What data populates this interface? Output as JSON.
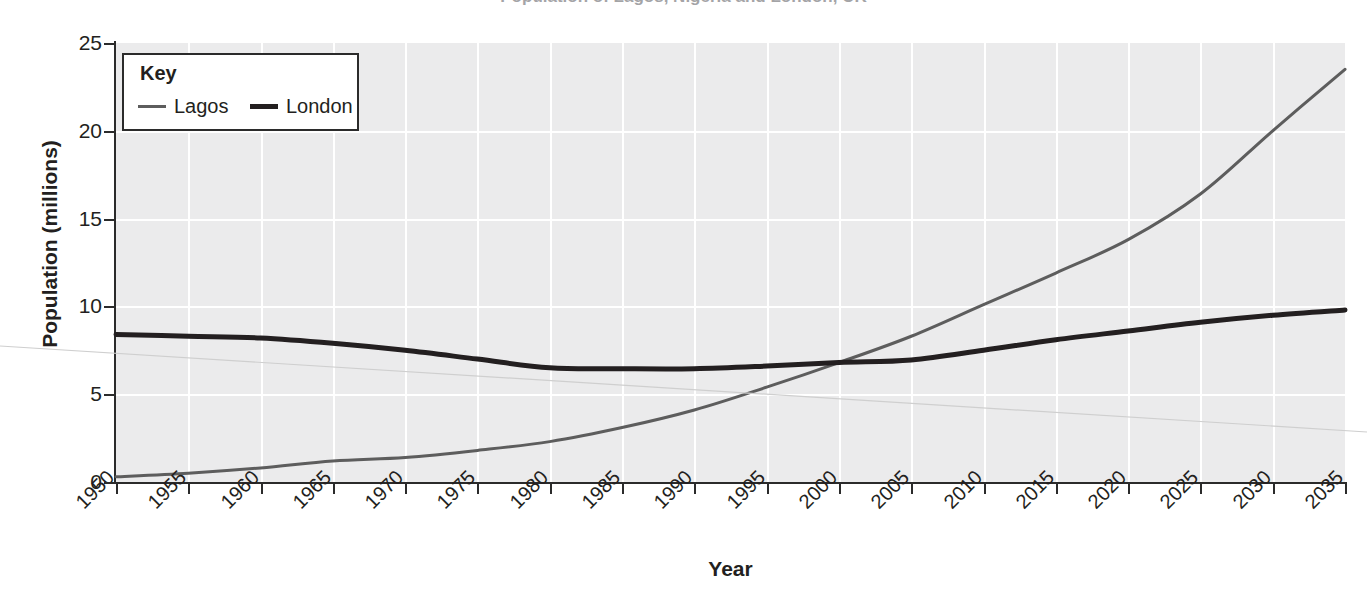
{
  "title_cropped": "Population of Lagos, Nigeria and London, UK",
  "chart_data": {
    "type": "line",
    "title": "Population of Lagos, Nigeria and London, UK",
    "xlabel": "Year",
    "ylabel": "Population (millions)",
    "xlim": [
      1950,
      2035
    ],
    "ylim": [
      0,
      25
    ],
    "grid": true,
    "legend_position": "top-left-inside",
    "legend_title": "Key",
    "x_tick_labels": [
      "1950",
      "1955",
      "1960",
      "1965",
      "1970",
      "1975",
      "1980",
      "1985",
      "1990",
      "1995",
      "2000",
      "2005",
      "2010",
      "2015",
      "2020",
      "2025",
      "2030",
      "2035"
    ],
    "y_tick_labels": [
      "0",
      "5",
      "10",
      "15",
      "20",
      "25"
    ],
    "x": [
      1950,
      1955,
      1960,
      1965,
      1970,
      1975,
      1980,
      1985,
      1990,
      1995,
      2000,
      2005,
      2010,
      2015,
      2020,
      2025,
      2030,
      2035
    ],
    "series": [
      {
        "name": "Lagos",
        "color": "#5d5d5d",
        "width": 3,
        "values": [
          0.3,
          0.5,
          0.8,
          1.2,
          1.4,
          1.8,
          2.3,
          3.1,
          4.1,
          5.4,
          6.8,
          8.3,
          10.1,
          11.9,
          13.8,
          16.4,
          20.0,
          23.5
        ]
      },
      {
        "name": "London",
        "color": "#231f20",
        "width": 5,
        "values": [
          8.4,
          8.3,
          8.2,
          7.9,
          7.5,
          7.0,
          6.5,
          6.45,
          6.45,
          6.6,
          6.8,
          6.95,
          7.5,
          8.1,
          8.6,
          9.1,
          9.5,
          9.8
        ]
      }
    ]
  },
  "axes": {
    "y_ticks": [
      {
        "label": "25",
        "value": 25
      },
      {
        "label": "20",
        "value": 20
      },
      {
        "label": "15",
        "value": 15
      },
      {
        "label": "10",
        "value": 10
      },
      {
        "label": "5",
        "value": 5
      },
      {
        "label": "0",
        "value": 0
      }
    ],
    "x_ticks": [
      {
        "label": "1950",
        "value": 1950
      },
      {
        "label": "1955",
        "value": 1955
      },
      {
        "label": "1960",
        "value": 1960
      },
      {
        "label": "1965",
        "value": 1965
      },
      {
        "label": "1970",
        "value": 1970
      },
      {
        "label": "1975",
        "value": 1975
      },
      {
        "label": "1980",
        "value": 1980
      },
      {
        "label": "1985",
        "value": 1985
      },
      {
        "label": "1990",
        "value": 1990
      },
      {
        "label": "1995",
        "value": 1995
      },
      {
        "label": "2000",
        "value": 2000
      },
      {
        "label": "2005",
        "value": 2005
      },
      {
        "label": "2010",
        "value": 2010
      },
      {
        "label": "2015",
        "value": 2015
      },
      {
        "label": "2020",
        "value": 2020
      },
      {
        "label": "2025",
        "value": 2025
      },
      {
        "label": "2030",
        "value": 2030
      },
      {
        "label": "2035",
        "value": 2035
      }
    ]
  },
  "legend": {
    "title": "Key",
    "entries": [
      {
        "label": "Lagos",
        "color": "#5d5d5d",
        "width": 3
      },
      {
        "label": "London",
        "color": "#231f20",
        "width": 5
      }
    ]
  },
  "style": {
    "panel_bg": "#ebebec",
    "grid_color": "#ffffff",
    "axis_color": "#2b2b2b",
    "text_color": "#231f20",
    "page_bg": "#ffffff"
  }
}
